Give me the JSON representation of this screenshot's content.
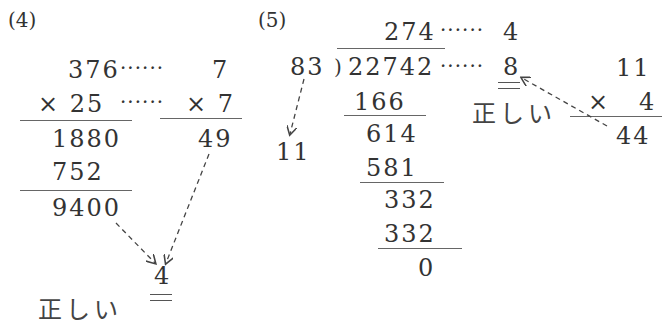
{
  "problem4": {
    "label": "(4)",
    "multiplicand": "376",
    "multiplier": "× 25",
    "partial1": "1880",
    "partial2": "752",
    "product": "9400",
    "check_a": "7",
    "check_b": "× 7",
    "check_result": "49",
    "check_digit": "4",
    "dots1": "······",
    "dots2": "······",
    "verdict": "正しい"
  },
  "problem5": {
    "label": "(5)",
    "quotient": "274",
    "divisor": "83",
    "bracket": ")",
    "dividend": "22742",
    "step1": "166",
    "step2": "614",
    "step3": "581",
    "step4": "332",
    "step5": "332",
    "remainder": "0",
    "divisor_check": "11",
    "quotient_check": "4",
    "dividend_check": "8",
    "dots1": "······",
    "dots2": "······",
    "mult_a": "11",
    "mult_b": "×   4",
    "mult_result": "44",
    "verdict": "正しい"
  }
}
